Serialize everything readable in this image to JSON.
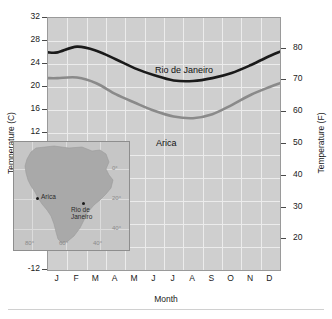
{
  "chart_data": {
    "type": "line",
    "title": "",
    "xlabel": "Month",
    "ylabel": "Temperature (C)",
    "ylabel_secondary": "Temperature (F)",
    "categories": [
      "J",
      "F",
      "M",
      "A",
      "M",
      "J",
      "J",
      "A",
      "S",
      "O",
      "N",
      "D"
    ],
    "ylim": [
      -12,
      32
    ],
    "ylim_secondary": [
      14,
      88
    ],
    "yticks": [
      "32",
      "28",
      "24",
      "20",
      "16",
      "12",
      "8",
      "4",
      "0",
      "-4",
      "-8",
      "-12"
    ],
    "yticks_secondary": [
      "80",
      "70",
      "60",
      "50",
      "40",
      "30",
      "20"
    ],
    "grid": true,
    "legend": "inline-labels",
    "series": [
      {
        "name": "Rio de Janeiro",
        "color": "#1a1a1a",
        "values": [
          26.0,
          27.0,
          26.3,
          24.8,
          23.2,
          22.0,
          21.1,
          21.0,
          21.5,
          22.4,
          23.8,
          25.4
        ]
      },
      {
        "name": "Arica",
        "color": "#8a8a8a",
        "values": [
          21.5,
          21.6,
          20.6,
          18.7,
          17.2,
          15.8,
          14.8,
          14.5,
          15.2,
          16.8,
          18.6,
          20.0
        ]
      }
    ]
  },
  "inset_map": {
    "region": "South America",
    "lat_labels": [
      "0°",
      "20°",
      "40°"
    ],
    "lon_labels": [
      "80°",
      "60°",
      "40°"
    ],
    "cities": [
      {
        "name": "Arica",
        "label_lines": [
          "Arica"
        ]
      },
      {
        "name": "Rio de Janeiro",
        "label_lines": [
          "Rio de",
          "Janeiro"
        ]
      }
    ]
  }
}
